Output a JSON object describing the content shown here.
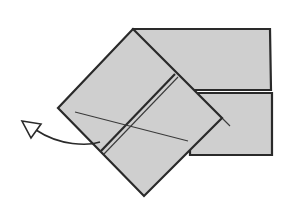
{
  "diagram": {
    "type": "origami-fold-step",
    "colors": {
      "paper": "#cfcfcf",
      "outline": "#2a2a2a",
      "background": "#ffffff",
      "arrow_fill": "#ffffff"
    },
    "shapes": {
      "upper_rectangle": "133,29 270,29 271,90 133,90",
      "lower_rectangle": "190,93 272,93 272,155 190,155",
      "diamond_flap": "133,29 222,118 144,196 58,108",
      "crease_outer": "175,74 101,151",
      "crease_inner": "178,77 104,154",
      "diagonal_line": "75,112 188,141",
      "diagonal_tail": "222,118 230,126",
      "arrow_path": "M100,142 C88,146 60,146 36,130",
      "arrow_head": "22,121 41,124 31,138"
    },
    "labels": []
  }
}
